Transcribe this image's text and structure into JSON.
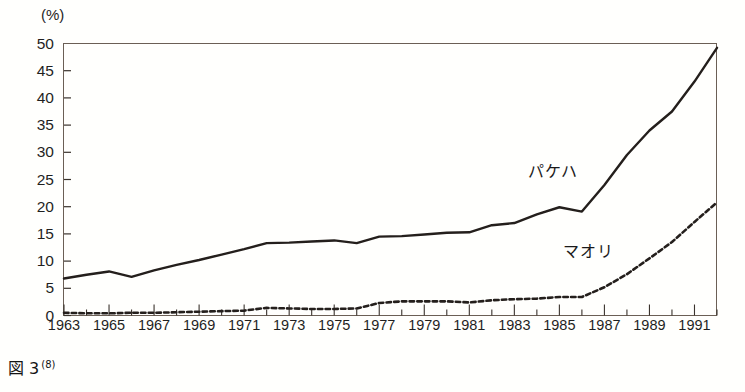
{
  "figure": {
    "caption_label": "図 3",
    "caption_note": "(8)",
    "unit_label": "(%)"
  },
  "chart_data": {
    "type": "line",
    "title": "",
    "xlabel": "",
    "ylabel": "(%)",
    "xlim": [
      1963,
      1992
    ],
    "ylim": [
      0,
      50
    ],
    "yticks": [
      0,
      5,
      10,
      15,
      20,
      25,
      30,
      35,
      40,
      45,
      50
    ],
    "xticks": [
      1963,
      1965,
      1967,
      1969,
      1971,
      1973,
      1975,
      1977,
      1979,
      1981,
      1983,
      1985,
      1987,
      1989,
      1991
    ],
    "x": [
      1963,
      1964,
      1965,
      1966,
      1967,
      1968,
      1969,
      1970,
      1971,
      1972,
      1973,
      1974,
      1975,
      1976,
      1977,
      1978,
      1979,
      1980,
      1981,
      1982,
      1983,
      1984,
      1985,
      1986,
      1987,
      1988,
      1989,
      1990,
      1991,
      1992
    ],
    "grid": false,
    "legend_position": "inline-annotation",
    "minor_xticks_every": 1,
    "series": [
      {
        "name": "パケハ",
        "style": "solid",
        "color": "#241f1c",
        "values": [
          6.8,
          7.5,
          8.1,
          7.1,
          8.3,
          9.3,
          10.2,
          11.2,
          12.2,
          13.3,
          13.4,
          13.6,
          13.8,
          13.3,
          14.5,
          14.6,
          14.9,
          15.2,
          15.3,
          16.6,
          17.0,
          18.6,
          19.9,
          19.1,
          24.0,
          29.5,
          34.0,
          37.5,
          43.0,
          49.2
        ]
      },
      {
        "name": "マオリ",
        "style": "dotted",
        "color": "#241f1c",
        "values": [
          0.5,
          0.4,
          0.4,
          0.5,
          0.5,
          0.6,
          0.7,
          0.8,
          0.9,
          1.4,
          1.3,
          1.2,
          1.2,
          1.3,
          2.3,
          2.6,
          2.6,
          2.6,
          2.4,
          2.8,
          3.0,
          3.1,
          3.4,
          3.4,
          5.2,
          7.6,
          10.5,
          13.5,
          17.2,
          20.8
        ]
      }
    ]
  }
}
